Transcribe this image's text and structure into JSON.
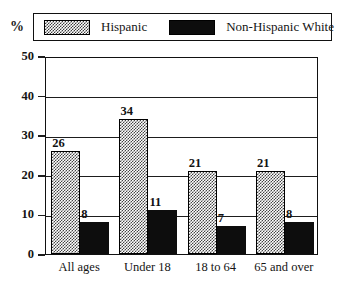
{
  "axis_unit_symbol": "%",
  "legend": {
    "items": [
      {
        "label": "Hispanic",
        "swatch": "dotted-gray-swatch-icon",
        "color": "#454545"
      },
      {
        "label": "Non-Hispanic White",
        "swatch": "solid-black-swatch-icon",
        "color": "#0d0d0d"
      }
    ]
  },
  "chart_data": {
    "type": "bar",
    "title": "",
    "xlabel": "",
    "ylabel": "%",
    "ylim": [
      0,
      50
    ],
    "yticks": [
      0,
      10,
      20,
      30,
      40,
      50
    ],
    "ytick_labels": [
      "0",
      "10",
      "20",
      "30",
      "40",
      "50"
    ],
    "grid": true,
    "legend_position": "top",
    "categories": [
      "All ages",
      "Under 18",
      "18 to 64",
      "65 and over"
    ],
    "series": [
      {
        "name": "Hispanic",
        "color": "#454545",
        "values": [
          26,
          34,
          21,
          21
        ],
        "value_labels": [
          "26",
          "34",
          "21",
          "21"
        ]
      },
      {
        "name": "Non-Hispanic White",
        "color": "#0d0d0d",
        "values": [
          8,
          11,
          7,
          8
        ],
        "value_labels": [
          "8",
          "11",
          "7",
          "8"
        ]
      }
    ]
  }
}
